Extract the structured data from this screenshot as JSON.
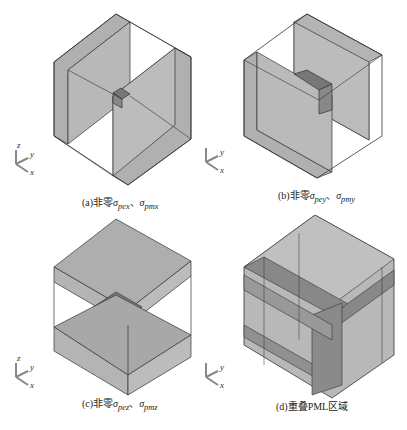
{
  "figure": {
    "panels": [
      {
        "id": "a",
        "caption_prefix": "(a)非零",
        "sigma1": "σ",
        "sub1": "pex",
        "sep": "、",
        "sigma2": "σ",
        "sub2": "pmx",
        "description": "Cube with nonzero PML slabs along x"
      },
      {
        "id": "b",
        "caption_prefix": "(b)非零",
        "sigma1": "σ",
        "sub1": "pey",
        "sep": "、",
        "sigma2": "σ",
        "sub2": "pmy",
        "description": "Cube with nonzero PML slabs along y"
      },
      {
        "id": "c",
        "caption_prefix": "(c)非零",
        "sigma1": "σ",
        "sub1": "pez",
        "sep": "、",
        "sigma2": "σ",
        "sub2": "pmz",
        "description": "Cube with nonzero PML slabs along z"
      },
      {
        "id": "d",
        "caption_prefix": "(d)重叠PML区域",
        "sigma1": "",
        "sub1": "",
        "sep": "",
        "sigma2": "",
        "sub2": "",
        "description": "Overlapping PML regions"
      }
    ],
    "axes_labels": {
      "z": "z",
      "y": "y",
      "x": "x"
    },
    "colors": {
      "slab": "#a8a8a8",
      "overlap": "#808080",
      "edge": "#333333"
    }
  }
}
